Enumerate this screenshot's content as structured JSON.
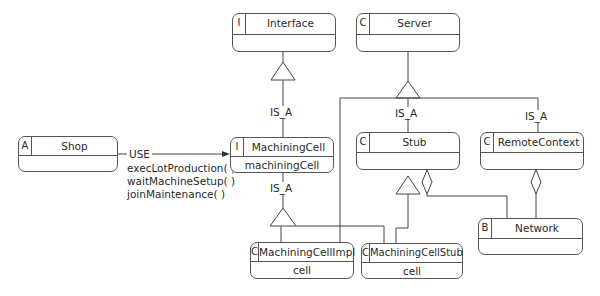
{
  "diagram": {
    "classes": {
      "interface": {
        "tag": "I",
        "name": "Interface",
        "attribute": ""
      },
      "server": {
        "tag": "C",
        "name": "Server",
        "attribute": ""
      },
      "shop": {
        "tag": "A",
        "name": "Shop",
        "attribute": ""
      },
      "machining_cell": {
        "tag": "I",
        "name": "MachiningCell",
        "attribute": "machiningCell"
      },
      "stub": {
        "tag": "C",
        "name": "Stub",
        "attribute": ""
      },
      "remote_context": {
        "tag": "C",
        "name": "RemoteContext",
        "attribute": ""
      },
      "network": {
        "tag": "B",
        "name": "Network",
        "attribute": ""
      },
      "machining_cell_impl": {
        "tag": "C",
        "name": "MachiningCellImpl",
        "attribute": "cell"
      },
      "machining_cell_stub": {
        "tag": "C",
        "name": "MachiningCellStub",
        "attribute": "cell"
      }
    },
    "relations": {
      "is_a": "IS_A",
      "use": "USE",
      "use_operations": [
        "execLotProduction( )",
        "waitMachineSetup( )",
        "joinMaintenance( )"
      ]
    }
  }
}
